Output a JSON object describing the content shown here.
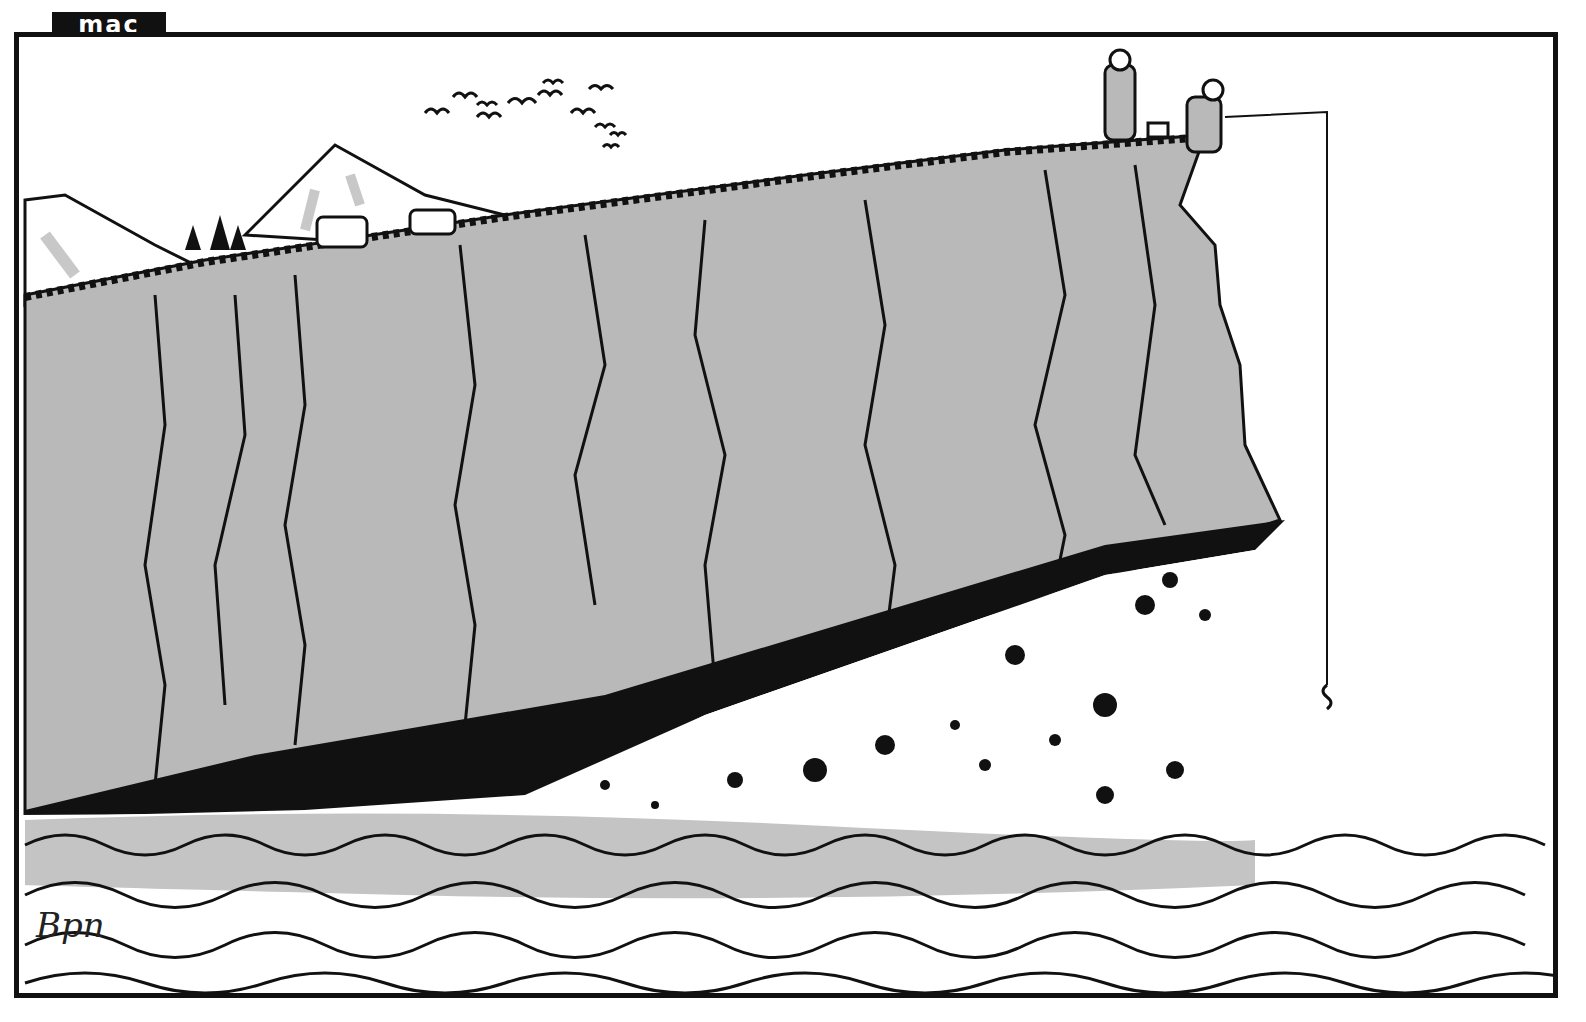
{
  "cartoon": {
    "publication_tag": "mac",
    "signature": "Bpn",
    "scene": {
      "description": "Two men in kilts and tam o'shanters on top of a huge grey cliff; one fishes with a very long line down to the sea. The cliff base is eroding into black and white debris falling into the waves.",
      "elements": [
        "birds-flock",
        "snowy-mountain",
        "highland-cattle",
        "pine-trees",
        "grassy-cliff-top",
        "standing-man-with-pipe",
        "tackle-box",
        "seated-fisherman",
        "fishing-line",
        "cracked-cliff-face",
        "black-rock-band",
        "falling-debris",
        "sea-waves",
        "small-fish-splash"
      ]
    },
    "colors": {
      "ink": "#111111",
      "cliff_grey": "#b9b9b9",
      "sea_grey": "#c4c4c4",
      "paper": "#ffffff"
    }
  }
}
